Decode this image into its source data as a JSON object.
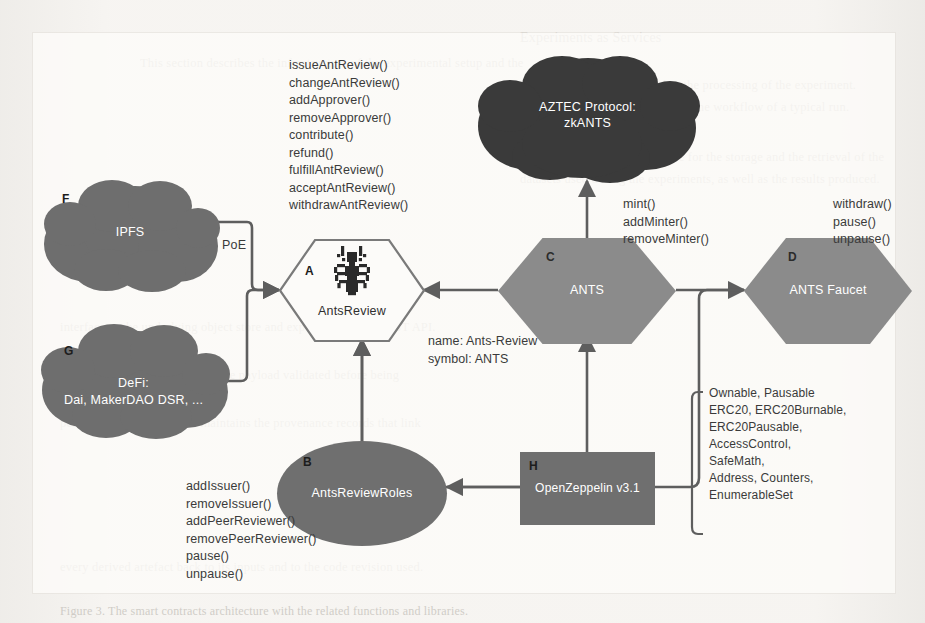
{
  "figure": {
    "background_note": "scanned book page"
  },
  "nodes": [
    {
      "id": "A",
      "tag": "A",
      "label": "AntsReview",
      "shape": "hexagon-outline",
      "color": "#ffffff",
      "icon": "ant-logo"
    },
    {
      "id": "B",
      "tag": "B",
      "label": "AntsReviewRoles",
      "shape": "ellipse",
      "color": "#6f6f6f"
    },
    {
      "id": "C",
      "tag": "C",
      "label": "ANTS",
      "shape": "hexagon",
      "color": "#8b8b8b"
    },
    {
      "id": "D",
      "tag": "D",
      "label": "ANTS Faucet",
      "shape": "hexagon",
      "color": "#8b8b8b"
    },
    {
      "id": "E",
      "tag": "",
      "label": "AZTEC Protocol:\nzkANTS",
      "label_line1": "AZTEC Protocol:",
      "label_line2": "zkANTS",
      "shape": "cloud",
      "color": "#3a3a3a"
    },
    {
      "id": "F",
      "tag": "F",
      "label": "IPFS",
      "shape": "cloud",
      "color": "#6e6e6e"
    },
    {
      "id": "G",
      "tag": "G",
      "label": "DeFi:\nDai, MakerDAO DSR, ...",
      "label_line1": "DeFi:",
      "label_line2": "Dai, MakerDAO DSR, ...",
      "shape": "cloud",
      "color": "#6e6e6e"
    },
    {
      "id": "H",
      "tag": "H",
      "label": "OpenZeppelin v3.1",
      "shape": "rectangle",
      "color": "#6f6f6f"
    }
  ],
  "annotations": {
    "antsreview_functions": "issueAntReview()\nchangeAntReview()\naddApprover()\nremoveApprover()\ncontribute()\nrefund()\nfulfillAntReview()\nacceptAntReview()\nwithdrawAntReview()",
    "ants_functions": "mint()\naddMinter()\nremoveMinter()",
    "faucet_functions": "withdraw()\npause()\nunpause()",
    "roles_functions": "addIssuer()\nremoveIssuer()\naddPeerReviewer()\nremovePeerReviewer()\npause()\nunpause()",
    "openzeppelin_libraries": "Ownable, Pausable\nERC20, ERC20Burnable,\nERC20Pausable,\nAccessControl,\nSafeMath,\nAddress, Counters,\nEnumerableSet",
    "token_meta": "name: Ants-Review\nsymbol: ANTS"
  },
  "edge_labels": {
    "poe": "PoE"
  },
  "background_text": {
    "line1": "Experiments as Services",
    "line2": "This section describes the infrastructure of the experimental setup and the",
    "line3": "individual services involved in the processing of the experiment.",
    "line4": "the whole of the architecture and the workflow of a typical run.",
    "line5": "Data Service",
    "line6": "The Data Service is responsible for the storage and the retrieval of the",
    "line7": "datasets used during the experiments, as well as the results produced.",
    "line8": "interface to the underlying object store and exposes a simple REST API.",
    "line9": "requests are authenticated and the payload validated before being",
    "line10": "persisted. The service also maintains the provenance records that link",
    "line11": "every derived artefact back to its inputs and to the code revision used.",
    "line12": "Figure 3. The smart contracts architecture with the related functions and libraries."
  },
  "colors": {
    "hex_fill": "#8b8b8b",
    "cloud_fill": "#6e6e6e",
    "cloud_dark_fill": "#3a3a3a",
    "node_fill": "#6f6f6f",
    "wire": "#5e5e5e",
    "text": "#3a3a3a",
    "label_text": "#ffffff"
  }
}
